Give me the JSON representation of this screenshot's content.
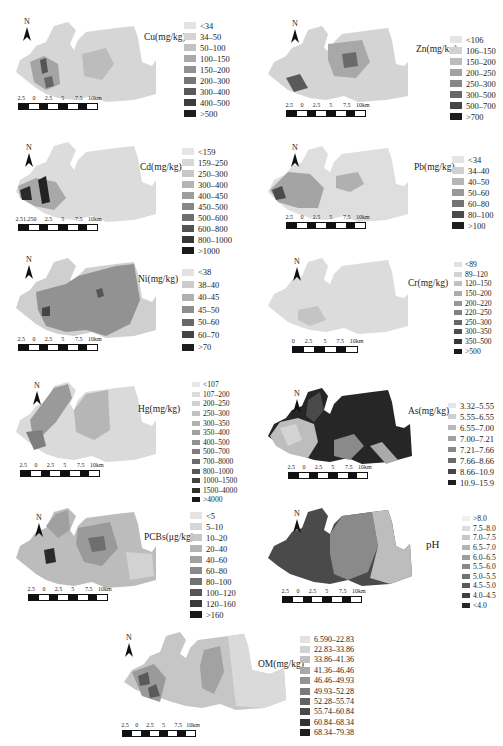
{
  "figure": {
    "panels": [
      {
        "id": "cu",
        "title": "Cu(mg/kg)",
        "north_label": "N",
        "scale_labels": [
          "2.5",
          "0",
          "2.5",
          "5",
          "7.5",
          "10km"
        ],
        "legend": [
          {
            "label": "<34",
            "color": "#e4e4e4"
          },
          {
            "label": "34–50",
            "color": "#d4d4d4"
          },
          {
            "label": "50–100",
            "color": "#c2c2c2"
          },
          {
            "label": "100–150",
            "color": "#aaaaaa"
          },
          {
            "label": "150–200",
            "color": "#919191"
          },
          {
            "label": "200–300",
            "color": "#777777"
          },
          {
            "label": "300–400",
            "color": "#5a5a5a"
          },
          {
            "label": "400–500",
            "color": "#3d3d3d"
          },
          {
            "label": ">500",
            "color": "#1e1e1e"
          }
        ]
      },
      {
        "id": "zn",
        "title": "Zn(mg/kg)",
        "north_label": "N",
        "scale_labels": [
          "2.5",
          "0",
          "2.5",
          "5",
          "7.5",
          "10km"
        ],
        "legend": [
          {
            "label": "<106",
            "color": "#e4e4e4"
          },
          {
            "label": "106–150",
            "color": "#d2d2d2"
          },
          {
            "label": "150–200",
            "color": "#bcbcbc"
          },
          {
            "label": "200–250",
            "color": "#a2a2a2"
          },
          {
            "label": "250–300",
            "color": "#878787"
          },
          {
            "label": "300–500",
            "color": "#686868"
          },
          {
            "label": "500–700",
            "color": "#454545"
          },
          {
            "label": ">700",
            "color": "#1e1e1e"
          }
        ]
      },
      {
        "id": "cd",
        "title": "Cd(mg/kg)",
        "north_label": "N",
        "scale_labels": [
          "2.51.250",
          "",
          "2.5",
          "5",
          "7.5",
          "10km"
        ],
        "legend": [
          {
            "label": "<159",
            "color": "#e6e6e6"
          },
          {
            "label": "159–250",
            "color": "#d8d8d8"
          },
          {
            "label": "250–300",
            "color": "#c8c8c8"
          },
          {
            "label": "300–400",
            "color": "#b4b4b4"
          },
          {
            "label": "400–450",
            "color": "#9e9e9e"
          },
          {
            "label": "450–500",
            "color": "#878787"
          },
          {
            "label": "500–600",
            "color": "#6e6e6e"
          },
          {
            "label": "600–800",
            "color": "#535353"
          },
          {
            "label": "800–1000",
            "color": "#383838"
          },
          {
            "label": ">1000",
            "color": "#1a1a1a"
          }
        ]
      },
      {
        "id": "pb",
        "title": "Pb(mg/kg)",
        "north_label": "N",
        "scale_labels": [
          "2.5",
          "0",
          "2.5",
          "5",
          "7.5",
          "10km"
        ],
        "legend": [
          {
            "label": "<34",
            "color": "#e4e4e4"
          },
          {
            "label": "34–40",
            "color": "#d0d0d0"
          },
          {
            "label": "40–50",
            "color": "#b6b6b6"
          },
          {
            "label": "50–60",
            "color": "#999999"
          },
          {
            "label": "60–80",
            "color": "#737373"
          },
          {
            "label": "80–100",
            "color": "#4a4a4a"
          },
          {
            "label": ">100",
            "color": "#1e1e1e"
          }
        ]
      },
      {
        "id": "ni",
        "title": "Ni(mg/kg)",
        "north_label": "N",
        "scale_labels": [
          "2.5",
          "0",
          "2.5",
          "5",
          "7.5",
          "10km"
        ],
        "legend": [
          {
            "label": "<38",
            "color": "#e2e2e2"
          },
          {
            "label": "38–40",
            "color": "#cccccc"
          },
          {
            "label": "40–45",
            "color": "#b0b0b0"
          },
          {
            "label": "45–50",
            "color": "#8e8e8e"
          },
          {
            "label": "50–60",
            "color": "#686868"
          },
          {
            "label": "60–70",
            "color": "#444444"
          },
          {
            "label": ">70",
            "color": "#1e1e1e"
          }
        ]
      },
      {
        "id": "cr",
        "title": "Cr(mg/kg)",
        "north_label": "N",
        "scale_labels": [
          "0",
          "2.5",
          "5",
          "7.5",
          "10km"
        ],
        "legend": [
          {
            "label": "<89",
            "color": "#e2e2e2"
          },
          {
            "label": "89–120",
            "color": "#d2d2d2"
          },
          {
            "label": "120–150",
            "color": "#c0c0c0"
          },
          {
            "label": "150–200",
            "color": "#acacac"
          },
          {
            "label": "200–220",
            "color": "#979797"
          },
          {
            "label": "220–250",
            "color": "#808080"
          },
          {
            "label": "250–300",
            "color": "#676767"
          },
          {
            "label": "300–350",
            "color": "#4e4e4e"
          },
          {
            "label": "350–500",
            "color": "#353535"
          },
          {
            "label": ">500",
            "color": "#1a1a1a"
          }
        ]
      },
      {
        "id": "hg",
        "title": "Hg(mg/kg)",
        "north_label": "N",
        "scale_labels": [
          "2.5",
          "0",
          "2.5",
          "5",
          "7.5",
          "10km"
        ],
        "legend": [
          {
            "label": "<107",
            "color": "#e8e8e8"
          },
          {
            "label": "107–200",
            "color": "#dcdcdc"
          },
          {
            "label": "200–250",
            "color": "#d0d0d0"
          },
          {
            "label": "250–300",
            "color": "#c2c2c2"
          },
          {
            "label": "300–350",
            "color": "#b2b2b2"
          },
          {
            "label": "350–400",
            "color": "#a2a2a2"
          },
          {
            "label": "400–500",
            "color": "#919191"
          },
          {
            "label": "500–700",
            "color": "#7f7f7f"
          },
          {
            "label": "700–8000",
            "color": "#6c6c6c"
          },
          {
            "label": "800–1000",
            "color": "#575757"
          },
          {
            "label": "1000–1500",
            "color": "#424242"
          },
          {
            "label": "1500–4000",
            "color": "#2e2e2e"
          },
          {
            "label": ">4000",
            "color": "#1a1a1a"
          }
        ]
      },
      {
        "id": "as",
        "title": "As(mg/kg)",
        "north_label": "N",
        "scale_labels": [
          "2.5",
          "0",
          "2.5",
          "5",
          "7.5",
          "10km"
        ],
        "legend": [
          {
            "label": "3.32–5.55",
            "color": "#e6e6e6"
          },
          {
            "label": "5.55–6.55",
            "color": "#cfcfcf"
          },
          {
            "label": "6.55–7.00",
            "color": "#b8b8b8"
          },
          {
            "label": "7.00–7.21",
            "color": "#a0a0a0"
          },
          {
            "label": "7.21–7.66",
            "color": "#878787"
          },
          {
            "label": "7.66–8.66",
            "color": "#6a6a6a"
          },
          {
            "label": "8.66–10.9",
            "color": "#464646"
          },
          {
            "label": "10.9–15.9",
            "color": "#1e1e1e"
          }
        ]
      },
      {
        "id": "pcbs",
        "title": "PCBs(μg/kg)",
        "north_label": "N",
        "scale_labels": [
          "2.5",
          "0",
          "2.5",
          "5",
          "7.5",
          "10km"
        ],
        "legend": [
          {
            "label": "<5",
            "color": "#e4e4e4"
          },
          {
            "label": "5–10",
            "color": "#d6d6d6"
          },
          {
            "label": "10–20",
            "color": "#c6c6c6"
          },
          {
            "label": "20–40",
            "color": "#b4b4b4"
          },
          {
            "label": "40–60",
            "color": "#a0a0a0"
          },
          {
            "label": "60–80",
            "color": "#8a8a8a"
          },
          {
            "label": "80–100",
            "color": "#717171"
          },
          {
            "label": "100–120",
            "color": "#565656"
          },
          {
            "label": "120–160",
            "color": "#3a3a3a"
          },
          {
            "label": ">160",
            "color": "#1a1a1a"
          }
        ]
      },
      {
        "id": "ph",
        "title": "pH",
        "north_label": "N",
        "scale_labels": [
          "2.5",
          "0",
          "2.5",
          "5",
          "7.5",
          "10km"
        ],
        "legend": [
          {
            "label": ">8.0",
            "color": "#f0f0f0"
          },
          {
            "label": "7.5–8.0",
            "color": "#dcdcdc"
          },
          {
            "label": "7.0–7.5",
            "color": "#c8c8c8"
          },
          {
            "label": "6.5–7.0",
            "color": "#b4b4b4"
          },
          {
            "label": "6.0–6.5",
            "color": "#9e9e9e"
          },
          {
            "label": "5.5–6.0",
            "color": "#888888"
          },
          {
            "label": "5.0–5.5",
            "color": "#717171"
          },
          {
            "label": "4.5–5.0",
            "color": "#595959"
          },
          {
            "label": "4.0–4.5",
            "color": "#404040"
          },
          {
            "label": "<4.0",
            "color": "#262626"
          }
        ]
      },
      {
        "id": "om",
        "title": "OM(mg/kg)",
        "north_label": "N",
        "scale_labels": [
          "2.5",
          "0",
          "2.5",
          "5",
          "7.5",
          "10km"
        ],
        "legend": [
          {
            "label": "6.590–22.83",
            "color": "#e2e2e2"
          },
          {
            "label": "22.83–33.86",
            "color": "#d2d2d2"
          },
          {
            "label": "33.86–41.36",
            "color": "#c0c0c0"
          },
          {
            "label": "41.36–46.46",
            "color": "#a9a9a9"
          },
          {
            "label": "46.46–49.93",
            "color": "#939393"
          },
          {
            "label": "49.93–52.28",
            "color": "#7b7b7b"
          },
          {
            "label": "52.28–55.74",
            "color": "#626262"
          },
          {
            "label": "55.74–60.84",
            "color": "#4a4a4a"
          },
          {
            "label": "60.84–68.34",
            "color": "#333333"
          },
          {
            "label": "68.34–79.38",
            "color": "#1e1e1e"
          }
        ]
      }
    ]
  }
}
